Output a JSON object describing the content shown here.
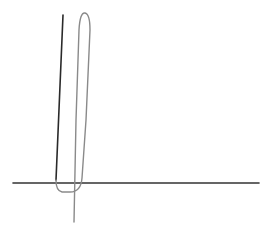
{
  "diagram": {
    "type": "line-sketch",
    "caption_fragment": "",
    "colors": {
      "background": "#ffffff",
      "axis": "#333333",
      "dark_line": "#2a2a2a",
      "curve": "#8a8a8a"
    },
    "axis": {
      "x1": 13,
      "y1": 183,
      "x2": 259,
      "y2": 183,
      "stroke_width": 1.6
    },
    "dark_line": {
      "x1": 63,
      "y1": 15,
      "x2": 56,
      "y2": 180,
      "stroke_width": 1.6
    },
    "curve": {
      "path": "M 74 222 L 76 120 L 79 30 Q 80 12 85 13 Q 90 14 90 30 L 86 120 L 82 178 Q 81 192 70 192 L 62 192 Q 56 191 56 180",
      "stroke_width": 1.4
    }
  }
}
